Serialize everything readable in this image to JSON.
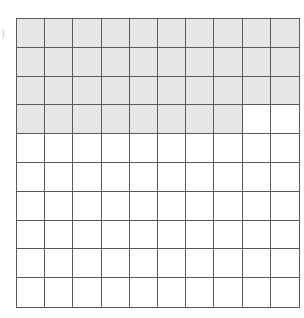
{
  "figure": {
    "type": "hundred-grid",
    "rows": 10,
    "columns": 10,
    "total_cells": 100,
    "shaded_cells": 38,
    "unshaded_cells": 62,
    "fill_order": "row-major from top-left",
    "shaded_rows": [
      {
        "row": 1,
        "shaded": 10
      },
      {
        "row": 2,
        "shaded": 10
      },
      {
        "row": 3,
        "shaded": 10
      },
      {
        "row": 4,
        "shaded": 8
      }
    ],
    "colors": {
      "shaded": "#e6e6e6",
      "unshaded": "#ffffff",
      "grid_line": "#5a5a5a"
    }
  },
  "fragment_mark": ")"
}
